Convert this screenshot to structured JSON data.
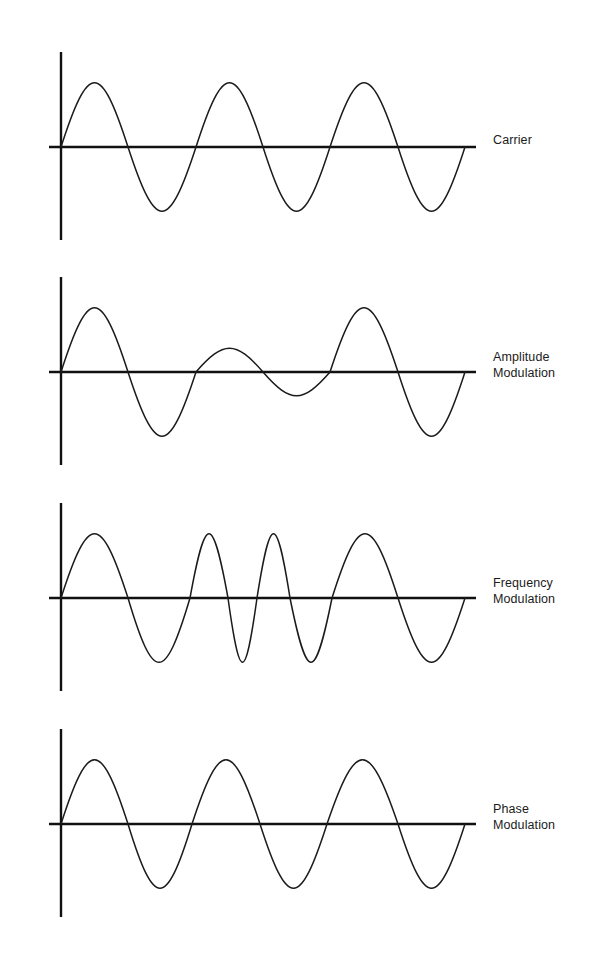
{
  "figure": {
    "title": "",
    "background_color": "#ffffff",
    "stroke_color": "#1b1b1b",
    "axis_color": "#111111",
    "width": 598,
    "height": 958
  },
  "panels": [
    {
      "id": "carrier",
      "label": "Carrier",
      "label_x": 493,
      "label_y": 141,
      "baseline_y": 147,
      "axis_x": 61,
      "axis_top": 52,
      "axis_bottom": 240,
      "axis_right": 476,
      "amplitude": 84,
      "wave_start_x": 61,
      "wave_end_x": 465
    },
    {
      "id": "amplitude-modulation",
      "label": "Amplitude\nModulation",
      "label_x": 493,
      "label_y": 358,
      "baseline_y": 372,
      "axis_x": 61,
      "axis_top": 277,
      "axis_bottom": 465,
      "axis_right": 476,
      "amplitude": 84,
      "wave_start_x": 61,
      "wave_end_x": 465
    },
    {
      "id": "frequency-modulation",
      "label": "Frequency\nModulation",
      "label_x": 493,
      "label_y": 584,
      "baseline_y": 598,
      "axis_x": 61,
      "axis_top": 503,
      "axis_bottom": 691,
      "axis_right": 476,
      "amplitude": 84,
      "wave_start_x": 61,
      "wave_end_x": 465
    },
    {
      "id": "phase-modulation",
      "label": "Phase\nModulation",
      "label_x": 493,
      "label_y": 810,
      "baseline_y": 824,
      "axis_x": 61,
      "axis_top": 729,
      "axis_bottom": 917,
      "axis_right": 476,
      "amplitude": 84,
      "wave_start_x": 61,
      "wave_end_x": 465
    }
  ],
  "chart_data": {
    "type": "line",
    "xlabel": "",
    "ylabel": "",
    "grid": false,
    "legend": "right",
    "x_range": [
      61,
      465
    ],
    "y_amplitude_px": 84,
    "series": [
      {
        "name": "Carrier",
        "description": "Unmodulated sinusoid, three full cycles of constant amplitude and constant period.",
        "cycles": 3,
        "zero_crossings": [
          61,
          128,
          196,
          263,
          330,
          398,
          465
        ],
        "peaks": [
          {
            "x": 95,
            "y": 1.0
          },
          {
            "x": 229,
            "y": 1.0
          },
          {
            "x": 364,
            "y": 1.0
          }
        ],
        "troughs": [
          {
            "x": 162,
            "y": -1.0
          },
          {
            "x": 296,
            "y": -1.0
          },
          {
            "x": 431,
            "y": -1.0
          }
        ],
        "envelope": [
          1.0,
          1.0,
          1.0
        ]
      },
      {
        "name": "Amplitude Modulation",
        "description": "Carrier whose envelope shrinks in the middle cycle and recovers; constant period, varying amplitude.",
        "cycles": 3,
        "zero_crossings": [
          61,
          128,
          196,
          263,
          330,
          398,
          465
        ],
        "peaks": [
          {
            "x": 95,
            "y": 1.0
          },
          {
            "x": 229,
            "y": 0.37
          },
          {
            "x": 364,
            "y": 1.0
          }
        ],
        "troughs": [
          {
            "x": 162,
            "y": -1.0
          },
          {
            "x": 296,
            "y": -0.37
          },
          {
            "x": 431,
            "y": -1.0
          }
        ],
        "envelope": [
          1.0,
          0.37,
          1.0
        ]
      },
      {
        "name": "Frequency Modulation",
        "description": "Constant amplitude sinusoid whose period shortens in the middle (two compressed cycles) then lengthens again.",
        "cycles": 4,
        "zero_crossings": [
          61,
          128,
          190,
          228,
          257,
          290,
          332,
          398,
          465
        ],
        "peaks": [
          {
            "x": 95,
            "y": 1.0
          },
          {
            "x": 209,
            "y": 1.0
          },
          {
            "x": 274,
            "y": 1.0
          },
          {
            "x": 365,
            "y": 1.0
          }
        ],
        "troughs": [
          {
            "x": 159,
            "y": -1.0
          },
          {
            "x": 243,
            "y": -1.0
          },
          {
            "x": 311,
            "y": -1.0
          },
          {
            "x": 432,
            "y": -1.0
          }
        ],
        "envelope": [
          1.0,
          1.0,
          1.0,
          1.0
        ]
      },
      {
        "name": "Phase Modulation",
        "description": "Constant amplitude sinusoid with abrupt phase jumps: a cusp where two troughs meet at x=192 and a cusp where two peaks meet at x=327.",
        "cycles": 3,
        "zero_crossings": [
          61,
          128,
          192,
          260,
          327,
          398,
          465
        ],
        "phase_discontinuities": [
          {
            "x": 192,
            "type": "trough-trough-cusp",
            "direction": "downward"
          },
          {
            "x": 327,
            "type": "peak-peak-cusp",
            "direction": "upward"
          }
        ],
        "peaks": [
          {
            "x": 95,
            "y": 1.0
          },
          {
            "x": 294,
            "y": 1.0
          },
          {
            "x": 360,
            "y": 1.0
          }
        ],
        "troughs": [
          {
            "x": 160,
            "y": -1.0
          },
          {
            "x": 226,
            "y": -1.0
          },
          {
            "x": 431,
            "y": -1.0
          }
        ],
        "envelope": [
          1.0,
          1.0,
          1.0
        ]
      }
    ]
  }
}
